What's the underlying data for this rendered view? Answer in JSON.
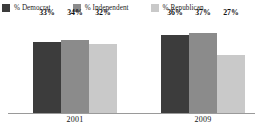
{
  "chart_data": {
    "type": "bar",
    "title": "",
    "subtitle": "",
    "xlabel": "",
    "ylabel": "",
    "categories": [
      "2001",
      "2009"
    ],
    "series": [
      {
        "name": "% Democrat",
        "values": [
          33,
          34
        ],
        "color": "#3c3c3c",
        "labels": [
          "33%",
          "36%"
        ]
      },
      {
        "name": "% Independent",
        "values": [
          34,
          37
        ],
        "color": "#8b8b8b",
        "labels": [
          "34%",
          "37%"
        ]
      },
      {
        "name": "% Republican",
        "values": [
          32,
          27
        ],
        "color": "#c9c9c9",
        "labels": [
          "32%",
          "27%"
        ]
      }
    ],
    "ylim": [
      0,
      44
    ],
    "grid": false,
    "legend_position": "top",
    "axis_line_color": "#9a9a9a",
    "background": "#ffffff"
  },
  "legend": {
    "items": [
      {
        "label": "% Democrat",
        "color": "#3c3c3c"
      },
      {
        "label": "% Independent",
        "color": "#8b8b8b"
      },
      {
        "label": "% Republican",
        "color": "#c9c9c9"
      }
    ]
  },
  "groups": [
    {
      "category": "2001",
      "bars": [
        {
          "series": "% Democrat",
          "value": 33,
          "label": "33%",
          "color": "#3c3c3c"
        },
        {
          "series": "% Independent",
          "value": 34,
          "label": "34%",
          "color": "#8b8b8b"
        },
        {
          "series": "% Republican",
          "value": 32,
          "label": "32%",
          "color": "#c9c9c9"
        }
      ]
    },
    {
      "category": "2009",
      "bars": [
        {
          "series": "% Democrat",
          "value": 36,
          "label": "36%",
          "color": "#3c3c3c"
        },
        {
          "series": "% Independent",
          "value": 37,
          "label": "37%",
          "color": "#8b8b8b"
        },
        {
          "series": "% Republican",
          "value": 27,
          "label": "27%",
          "color": "#c9c9c9"
        }
      ]
    }
  ]
}
